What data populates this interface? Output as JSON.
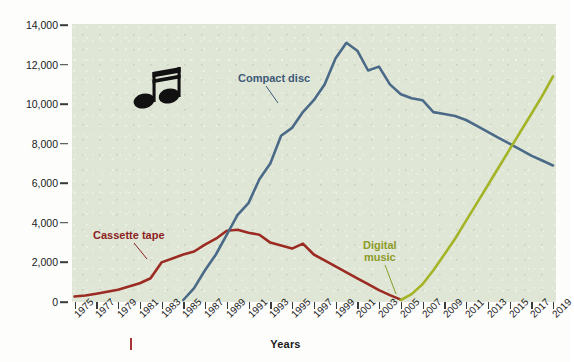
{
  "chart_data": {
    "type": "line",
    "title": "",
    "xlabel": "Years",
    "ylabel": "Retail dollar sales (in millions)",
    "xlim": [
      1975,
      2019
    ],
    "ylim": [
      0,
      14000
    ],
    "grid": false,
    "legend_position": "inline-annotations",
    "x_tick_labels": [
      "1975",
      "1977",
      "1979",
      "1981",
      "1983",
      "1985",
      "1987",
      "1989",
      "1991",
      "1993",
      "1995",
      "1997",
      "1999",
      "2001",
      "2003",
      "2005",
      "2007",
      "2009",
      "2011",
      "2013",
      "2015",
      "2017",
      "2019"
    ],
    "y_tick_labels": [
      "0",
      "2,000",
      "4,000",
      "6,000",
      "8,000",
      "10,000",
      "12,000",
      "14,000"
    ],
    "y_tick_values": [
      0,
      2000,
      4000,
      6000,
      8000,
      10000,
      12000,
      14000
    ],
    "series": [
      {
        "name": "Cassette tape",
        "color": "#9c2b23",
        "x": [
          1975,
          1976,
          1977,
          1978,
          1979,
          1980,
          1981,
          1982,
          1983,
          1984,
          1985,
          1986,
          1987,
          1988,
          1989,
          1990,
          1991,
          1992,
          1993,
          1994,
          1995,
          1996,
          1997,
          1998,
          1999,
          2000,
          2001,
          2002,
          2003,
          2004,
          2005
        ],
        "values": [
          280,
          330,
          420,
          520,
          620,
          780,
          950,
          1200,
          2000,
          2200,
          2400,
          2550,
          2900,
          3200,
          3600,
          3650,
          3500,
          3400,
          3000,
          2850,
          2700,
          2950,
          2400,
          2100,
          1800,
          1500,
          1200,
          900,
          600,
          350,
          120
        ]
      },
      {
        "name": "Compact disc",
        "color": "#4b6a87",
        "x": [
          1985,
          1986,
          1987,
          1988,
          1989,
          1990,
          1991,
          1992,
          1993,
          1994,
          1995,
          1996,
          1997,
          1998,
          1999,
          2000,
          2001,
          2002,
          2003,
          2004,
          2005,
          2006,
          2007,
          2008,
          2009,
          2010,
          2011,
          2012,
          2013,
          2014,
          2015,
          2016,
          2017,
          2018,
          2019
        ],
        "values": [
          100,
          700,
          1600,
          2400,
          3400,
          4400,
          5000,
          6200,
          7000,
          8400,
          8800,
          9600,
          10200,
          11000,
          12300,
          13100,
          12700,
          11700,
          11900,
          11000,
          10500,
          10300,
          10200,
          9600,
          9500,
          9400,
          9200,
          8900,
          8600,
          8300,
          8000,
          7700,
          7400,
          7150,
          6900
        ]
      },
      {
        "name": "Digital music",
        "color": "#a3b427",
        "x": [
          2005,
          2006,
          2007,
          2008,
          2009,
          2010,
          2011,
          2012,
          2013,
          2014,
          2015,
          2016,
          2017,
          2018,
          2019
        ],
        "values": [
          100,
          400,
          900,
          1600,
          2400,
          3200,
          4100,
          5000,
          5900,
          6800,
          7700,
          8600,
          9500,
          10400,
          11400
        ]
      }
    ]
  },
  "annotations": {
    "cd_label": "Compact disc",
    "cassette_label": "Cassette tape",
    "digital_label": "Digital\nmusic"
  },
  "icons": {
    "music_note": "music-note-icon"
  },
  "axis": {
    "x_title": "Years",
    "y_title": "Retail dollar sales (in millions)"
  },
  "colors": {
    "plot_background": "#dfe6d6",
    "cassette": "#9c2b23",
    "compact_disc": "#4b6a87",
    "digital_music": "#a3b427",
    "text": "#1b1b1b"
  }
}
